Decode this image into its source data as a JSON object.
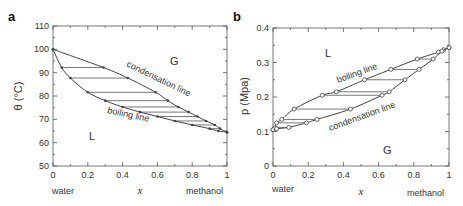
{
  "chart_data": [
    {
      "panel": "a",
      "type": "line",
      "title": "",
      "xlabel": "x",
      "ylabel": "θ (°C)",
      "xlim": [
        0,
        1
      ],
      "ylim": [
        50,
        110
      ],
      "xticks": [
        "0",
        "0.2",
        "0.4",
        "0.6",
        "0.8",
        "1"
      ],
      "yticks": [
        "50",
        "60",
        "70",
        "80",
        "90",
        "100",
        "110"
      ],
      "x_left_label": "water",
      "x_right_label": "methanol",
      "region_labels": {
        "gas": "G",
        "liquid": "L"
      },
      "series": [
        {
          "name": "condensation line",
          "x": [
            0,
            0.29,
            0.43,
            0.59,
            0.66,
            0.72,
            0.78,
            0.83,
            0.88,
            0.93,
            0.96,
            1.0
          ],
          "y": [
            100,
            92.2,
            87.7,
            81.6,
            78.0,
            75.3,
            73.1,
            71.2,
            69.3,
            67.6,
            66.0,
            64.5
          ]
        },
        {
          "name": "boiling line",
          "x": [
            0,
            0.05,
            0.1,
            0.2,
            0.3,
            0.4,
            0.5,
            0.6,
            0.7,
            0.8,
            0.9,
            0.95,
            1.0
          ],
          "y": [
            100,
            92.2,
            87.7,
            81.6,
            78.0,
            75.3,
            73.1,
            71.2,
            69.3,
            67.6,
            66.0,
            65.0,
            64.5
          ]
        }
      ],
      "tie_lines_y": [
        92.2,
        87.7,
        81.6,
        78.0,
        75.3,
        73.1,
        71.2,
        69.3,
        67.6,
        66.0
      ],
      "annotations": [
        "condensation line",
        "boiling line"
      ]
    },
    {
      "panel": "b",
      "type": "line",
      "title": "",
      "xlabel": "x",
      "ylabel": "p (Mpa)",
      "xlim": [
        0,
        1
      ],
      "ylim": [
        0,
        0.4
      ],
      "xticks": [
        "0",
        "0.2",
        "0.4",
        "0.6",
        "0.8",
        "1"
      ],
      "yticks": [
        "0",
        "0.1",
        "0.2",
        "0.3",
        "0.4"
      ],
      "x_left_label": "water",
      "x_right_label": "methanol",
      "region_labels": {
        "gas": "G",
        "liquid": "L"
      },
      "series": [
        {
          "name": "boiling line",
          "x": [
            0,
            0.01,
            0.02,
            0.05,
            0.12,
            0.28,
            0.36,
            0.52,
            0.67,
            0.82,
            0.94,
            0.97,
            1.0
          ],
          "y": [
            0.105,
            0.11,
            0.125,
            0.135,
            0.165,
            0.205,
            0.215,
            0.25,
            0.28,
            0.31,
            0.33,
            0.337,
            0.343
          ]
        },
        {
          "name": "condensation line",
          "x": [
            0,
            0.02,
            0.09,
            0.19,
            0.25,
            0.44,
            0.62,
            0.66,
            0.75,
            0.83,
            0.91,
            0.96,
            1.0
          ],
          "y": [
            0.105,
            0.108,
            0.112,
            0.125,
            0.135,
            0.165,
            0.205,
            0.215,
            0.25,
            0.28,
            0.31,
            0.333,
            0.343
          ]
        }
      ],
      "tie_lines_y": [
        0.112,
        0.125,
        0.135,
        0.165,
        0.205,
        0.215,
        0.25,
        0.28,
        0.31,
        0.33
      ],
      "annotations": [
        "boiling line",
        "condensation line"
      ]
    }
  ],
  "panels": {
    "a": {
      "letter": "a",
      "ylabel": "θ (°C)",
      "xlabel": "x",
      "left": "water",
      "right": "methanol",
      "G": "G",
      "L": "L",
      "cond": "condensation line",
      "boil": "boiling line"
    },
    "b": {
      "letter": "b",
      "ylabel": "p (Mpa)",
      "xlabel": "x",
      "left": "water",
      "right": "methanol",
      "G": "G",
      "L": "L",
      "cond": "condensation line",
      "boil": "boiling line"
    }
  }
}
